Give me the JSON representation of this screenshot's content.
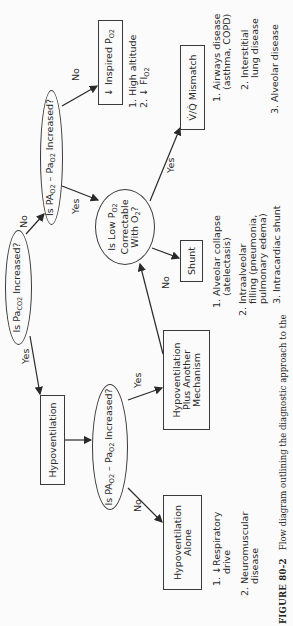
{
  "nodes": {
    "paco2_question": {
      "pre": "Is Pa",
      "sub": "CO2",
      "post": " Increased?"
    },
    "gradient_question_top": {
      "pre": "Is PA",
      "sub1": "O2",
      "mid": " – Pa",
      "sub2": "O2",
      "post": " Increased?"
    },
    "correctable_question": {
      "line1_pre": "Is Low P",
      "line1_sub": "O2",
      "line2": "Correctable",
      "line3_pre": "With O",
      "line3_sub": "2",
      "line3_post": "?"
    },
    "inspired_po2": {
      "arrow": "↓",
      "pre": "Inspired P",
      "sub": "O2"
    },
    "vq_mismatch": {
      "text": "V̇/Q̇ Mismatch"
    },
    "shunt": {
      "text": "Shunt"
    },
    "hypoventilation": {
      "text": "Hypoventilation"
    },
    "gradient_question_bottom": {
      "pre": "Is PA",
      "sub1": "O2",
      "mid": " – Pa",
      "sub2": "O2",
      "post": " Increased?"
    },
    "hypo_plus": {
      "line1": "Hypoventilation",
      "line2": "Plus Another",
      "line3": "Mechanism"
    },
    "hypo_alone": {
      "line1": "Hypoventilation",
      "line2": "Alone"
    }
  },
  "edge_labels": {
    "paco2_yes": "Yes",
    "paco2_no": "No",
    "gradient_top_yes": "Yes",
    "gradient_top_no": "No",
    "correctable_yes": "Yes",
    "correctable_no": "No",
    "gradient_bottom_yes": "Yes",
    "gradient_bottom_no": "No"
  },
  "lists": {
    "inspired_po2_causes": [
      {
        "num": "1.",
        "text": "High altitude"
      },
      {
        "num": "2.",
        "arrow": "↓",
        "pre": "FI",
        "sub": "O2"
      }
    ],
    "vq_causes": [
      {
        "num": "1.",
        "line1": "Airways disease",
        "line2": "(asthma, COPD)"
      },
      {
        "num": "2.",
        "line1": "Interstitial",
        "line2": "lung disease"
      },
      {
        "num": "3.",
        "line1": "Alveolar disease",
        "line2": ""
      }
    ],
    "shunt_causes": [
      {
        "num": "1.",
        "line1": "Alveolar collapse",
        "line2": "(atelectasis)"
      },
      {
        "num": "2.",
        "line1": "Intraalveolar",
        "line2": "filling (pneumonia,",
        "line3": "pulmonary edema)"
      },
      {
        "num": "3.",
        "line1": "Intracardiac shunt",
        "line2": ""
      }
    ],
    "hypo_alone_causes": [
      {
        "num": "1.",
        "arrow": "↓",
        "line1": "Respiratory",
        "line2": "drive"
      },
      {
        "num": "2.",
        "line1": "Neuromuscular",
        "line2": "disease"
      }
    ]
  },
  "caption": {
    "label": "FIGURE 80-2",
    "text": "Flow diagram outlining the diagnostic approach to the"
  },
  "colors": {
    "ink": "#2a2a2a",
    "paper": "#fbfbfb"
  }
}
